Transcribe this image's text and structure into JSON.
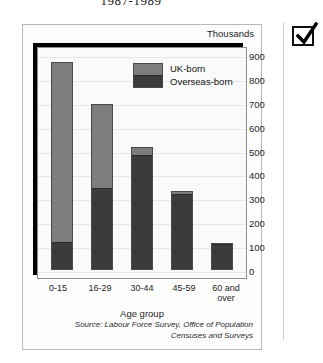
{
  "document": {
    "title": "1987-1989"
  },
  "figure": {
    "units_caption": "Thousands",
    "source_line_1": "Source: Labour Force Survey, Office of Population",
    "source_line_2": "Censuses and Surveys",
    "checkbox_icon": "checkmark-icon"
  },
  "chart_data": {
    "type": "bar",
    "stacked": true,
    "title": "1987-1989",
    "xlabel": "Age group",
    "ylabel": "Thousands",
    "ylim": [
      0,
      900
    ],
    "yticks": [
      900,
      800,
      700,
      600,
      500,
      400,
      300,
      200,
      100,
      0
    ],
    "grid": true,
    "legend_position": "inside-top-center",
    "categories": [
      "0-15",
      "16-29",
      "30-44",
      "45-59",
      "60 and over"
    ],
    "series": [
      {
        "name": "UK-born",
        "color": "#7d7d7d",
        "values": [
          765,
          355,
          30,
          10,
          0
        ]
      },
      {
        "name": "Overseas-born",
        "color": "#3b3b3b",
        "values": [
          115,
          345,
          490,
          325,
          115
        ]
      }
    ],
    "totals": [
      880,
      700,
      520,
      335,
      115
    ]
  }
}
